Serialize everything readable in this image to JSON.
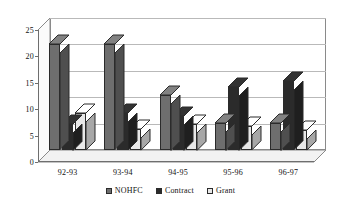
{
  "chart_data": {
    "type": "bar",
    "title": "",
    "subtitle": "",
    "xlabel": "",
    "ylabel": "",
    "categories": [
      "92-93",
      "93-94",
      "94-95",
      "95-96",
      "96-97"
    ],
    "series": [
      {
        "name": "NOHFC",
        "color": "#6e6e6e",
        "values": [
          20,
          20,
          10.5,
          5.2,
          5.2
        ]
      },
      {
        "name": "Contract",
        "color": "#2b2b2b",
        "values": [
          5,
          7,
          6.5,
          12,
          13
        ]
      },
      {
        "name": "Grant",
        "color": "#e8e8e8",
        "values": [
          7,
          4,
          5,
          4.5,
          3.8
        ]
      }
    ],
    "ylim": [
      0,
      25
    ],
    "yticks": [
      0,
      5,
      10,
      15,
      20,
      25
    ],
    "ytick_labels": [
      "0",
      "5",
      "10",
      "15",
      "20",
      "25"
    ],
    "grid": true,
    "grid_axis": "y",
    "legend_position": "bottom",
    "style": "3d-column",
    "plot_border": true,
    "colors": {
      "grid": "#b9b9b9",
      "axis": "#6e6e6e",
      "wall": "#ffffff",
      "wall_border": "#8a8a8a",
      "floor": "#f2f2f2",
      "side_wall": "#fbfbfb",
      "bar_outline": "#2b2b2b",
      "text": "#111111",
      "background": "#ffffff"
    }
  },
  "legend": {
    "items": [
      {
        "label": "NOHFC",
        "color": "#6e6e6e"
      },
      {
        "label": "Contract",
        "color": "#2b2b2b"
      },
      {
        "label": "Grant",
        "color": "#e8e8e8"
      }
    ]
  }
}
